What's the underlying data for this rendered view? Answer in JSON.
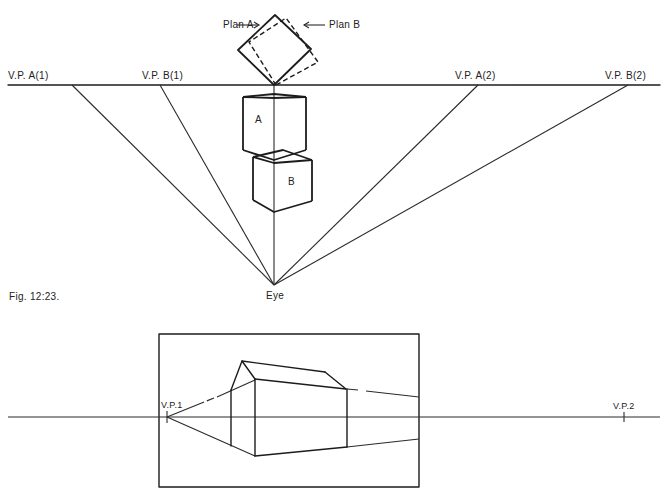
{
  "figure": {
    "caption": "Fig. 12:23."
  },
  "top_diagram": {
    "plan_labels": {
      "plan_a": "Plan A",
      "plan_b": "Plan B"
    },
    "vanishing_points": [
      {
        "label": "V.P. A(1)"
      },
      {
        "label": "V.P. B(1)"
      },
      {
        "label": "V.P. A(2)"
      },
      {
        "label": "V.P. B(2)"
      }
    ],
    "boxes": [
      {
        "label": "A"
      },
      {
        "label": "B"
      }
    ],
    "station_point": "Eye"
  },
  "bottom_diagram": {
    "vanishing_points": [
      {
        "label": "V.P.1"
      },
      {
        "label": "V.P.2"
      }
    ]
  }
}
